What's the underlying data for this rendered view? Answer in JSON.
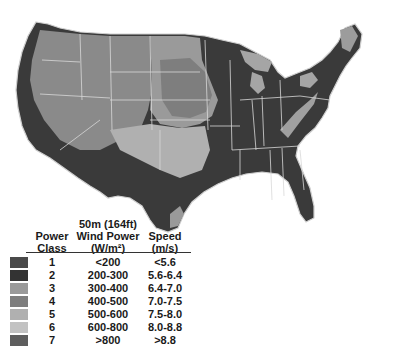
{
  "map": {
    "subject": "United States wind resource map at 50 m height",
    "colors": {
      "class1": "#4a4a4a",
      "class2": "#333333",
      "class3": "#9a9a9a",
      "class4": "#7e7e7e",
      "class5": "#b0b0b0",
      "class6": "#c2c2c2",
      "class7": "#5e5e5e",
      "border": "#d8d8d8"
    }
  },
  "legend": {
    "header_power_class": "Power\nClass",
    "header_power_class_line1": "Power",
    "header_power_class_line2": "Class",
    "header_wind_power_line1": "50m (164ft)",
    "header_wind_power_line2": "Wind Power",
    "header_wind_power_line3": "(W/m²)",
    "header_speed_line1": "Speed",
    "header_speed_line2": "(m/s)",
    "rows": [
      {
        "class": "1",
        "power": "<200",
        "speed": "<5.6",
        "color": "#4a4a4a"
      },
      {
        "class": "2",
        "power": "200-300",
        "speed": "5.6-6.4",
        "color": "#333333"
      },
      {
        "class": "3",
        "power": "300-400",
        "speed": "6.4-7.0",
        "color": "#9a9a9a"
      },
      {
        "class": "4",
        "power": "400-500",
        "speed": "7.0-7.5",
        "color": "#7e7e7e"
      },
      {
        "class": "5",
        "power": "500-600",
        "speed": "7.5-8.0",
        "color": "#b0b0b0"
      },
      {
        "class": "6",
        "power": "600-800",
        "speed": "8.0-8.8",
        "color": "#c2c2c2"
      },
      {
        "class": "7",
        "power": ">800",
        "speed": ">8.8",
        "color": "#5e5e5e"
      }
    ]
  }
}
